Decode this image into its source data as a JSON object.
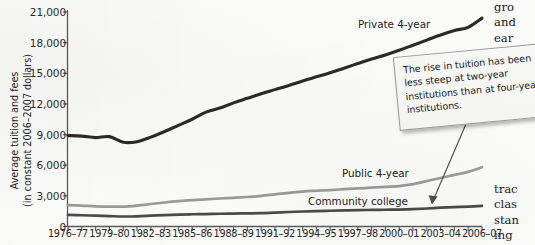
{
  "chart_data": {
    "type": "line",
    "title": "",
    "xlabel": "",
    "ylabel": "Average tuition and fees\n(in constant 2006–2007 dollars)",
    "ylim": [
      0,
      21000
    ],
    "ytick_values": [
      0,
      3000,
      6000,
      9000,
      12000,
      15000,
      18000,
      21000
    ],
    "ytick_labels": [
      "0",
      "3,000",
      "6,000",
      "9,000",
      "12,000",
      "15,000",
      "18,000",
      "21,000"
    ],
    "grid": false,
    "legend_position": "inline-labels",
    "x": [
      "1976–77",
      "1977–78",
      "1978–79",
      "1979–80",
      "1980–81",
      "1981–82",
      "1982–83",
      "1983–84",
      "1984–85",
      "1985–86",
      "1986–87",
      "1987–88",
      "1988–89",
      "1989–90",
      "1990–91",
      "1991–92",
      "1992–93",
      "1993–94",
      "1994–95",
      "1995–96",
      "1996–97",
      "1997–98",
      "1998–99",
      "1999–00",
      "2000–01",
      "2001–02",
      "2002–03",
      "2003–04",
      "2004–05",
      "2005–06",
      "2006–07"
    ],
    "xtick_labels": [
      "1976–77",
      "1979–80",
      "1982–83",
      "1985–86",
      "1988–89",
      "1991–92",
      "1994–95",
      "1997–98",
      "2000–01",
      "2003–04",
      "2006–07"
    ],
    "xtick_indices": [
      0,
      3,
      6,
      9,
      12,
      15,
      18,
      21,
      24,
      27,
      30
    ],
    "series": [
      {
        "name": "Private 4-year",
        "color": "#2a2a2a",
        "values": [
          8900,
          8850,
          8700,
          8800,
          8250,
          8300,
          8750,
          9300,
          9900,
          10500,
          11200,
          11600,
          12100,
          12550,
          13000,
          13400,
          13800,
          14250,
          14650,
          15050,
          15500,
          15950,
          16400,
          16800,
          17250,
          17750,
          18250,
          18750,
          19200,
          19500,
          20400
        ]
      },
      {
        "name": "Public 4-year",
        "color": "#9a9a9a",
        "values": [
          2100,
          2050,
          1980,
          1950,
          1950,
          2050,
          2200,
          2350,
          2480,
          2580,
          2660,
          2740,
          2810,
          2890,
          2990,
          3150,
          3300,
          3420,
          3500,
          3570,
          3650,
          3730,
          3800,
          3880,
          3960,
          4150,
          4450,
          4750,
          5050,
          5350,
          5800
        ]
      },
      {
        "name": "Community college",
        "color": "#4a4a4a",
        "values": [
          1130,
          1100,
          1060,
          1020,
          980,
          1000,
          1060,
          1120,
          1170,
          1200,
          1220,
          1250,
          1270,
          1290,
          1310,
          1360,
          1420,
          1470,
          1510,
          1540,
          1570,
          1600,
          1620,
          1640,
          1660,
          1700,
          1760,
          1840,
          1900,
          1950,
          2020
        ]
      }
    ],
    "annotations": [
      {
        "name": "two-year-note",
        "text": "The rise in tuition has been less steep at two-year institutions than at four-year institutions.",
        "points_to": "Community college"
      }
    ]
  },
  "axis": {
    "y_title": "Average tuition and fees\n(in constant 2006–2007 dollars)"
  },
  "labels": {
    "private": "Private 4-year",
    "public": "Public 4-year",
    "community": "Community college"
  },
  "callout": {
    "text": "The rise in tuition has been less steep at two-year institutions than at four-year institutions."
  },
  "margin_text": {
    "top": "gro\nand\near\nfirs",
    "bottom": "trac\nclas\nstan\ning"
  }
}
